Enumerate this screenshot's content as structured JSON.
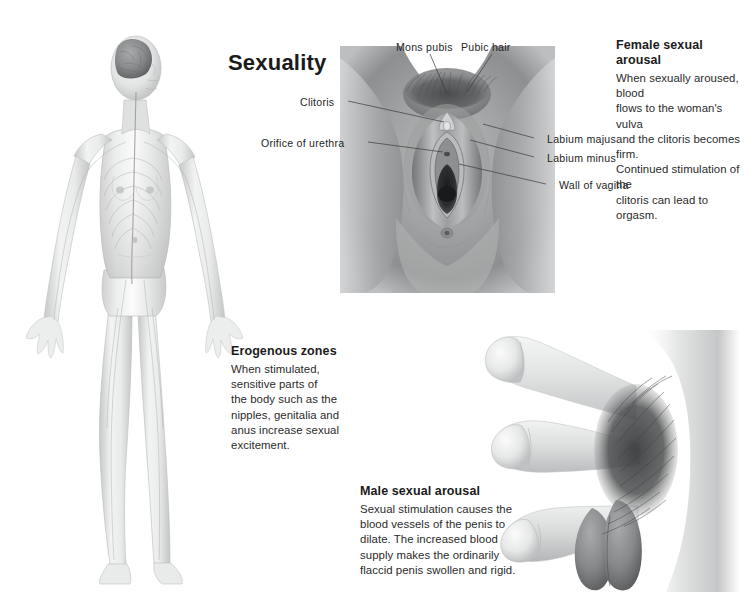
{
  "page": {
    "title": "Sexuality",
    "background_color": "#ffffff",
    "text_color": "#231f20",
    "width": 751,
    "height": 595
  },
  "illustrations": {
    "body_figure": {
      "name": "female-nervous-system-figure",
      "description": "Translucent full-body female figure showing brain, spinal cord and peripheral nerves"
    },
    "vulva_figure": {
      "name": "female-external-genitalia-figure",
      "description": "Anterior view of female external genitalia"
    },
    "penis_figure": {
      "name": "male-arousal-sequence-figure",
      "description": "Three stages of penis from flaccid to erect"
    }
  },
  "callouts": [
    {
      "id": "female_sexual_arousal",
      "heading": "Female sexual arousal",
      "lines": [
        "When sexually aroused, blood",
        "flows to the woman's vulva",
        "and the clitoris becomes firm.",
        "Continued stimulation of the",
        "clitoris can lead to orgasm."
      ]
    },
    {
      "id": "erogenous_zones",
      "heading": "Erogenous zones",
      "lines": [
        "When stimulated,",
        "sensitive parts of",
        "the body such as the",
        "nipples, genitalia and",
        "anus increase sexual",
        "excitement."
      ]
    },
    {
      "id": "male_sexual_arousal",
      "heading": "Male sexual arousal",
      "lines": [
        "Sexual stimulation causes the",
        "blood vessels of the penis to",
        "dilate. The increased blood",
        "supply makes the ordinarily",
        "flaccid penis swollen and rigid."
      ]
    }
  ],
  "annotations": [
    {
      "id": "mons_pubis",
      "label": "Mons pubis"
    },
    {
      "id": "pubic_hair",
      "label": "Pubic hair"
    },
    {
      "id": "clitoris",
      "label": "Clitoris"
    },
    {
      "id": "orifice_of_urethra",
      "label": "Orifice of urethra"
    },
    {
      "id": "labium_majus",
      "label": "Labium majus"
    },
    {
      "id": "labium_minus",
      "label": "Labium minus"
    },
    {
      "id": "wall_of_vagina",
      "label": "Wall of vagina"
    }
  ]
}
